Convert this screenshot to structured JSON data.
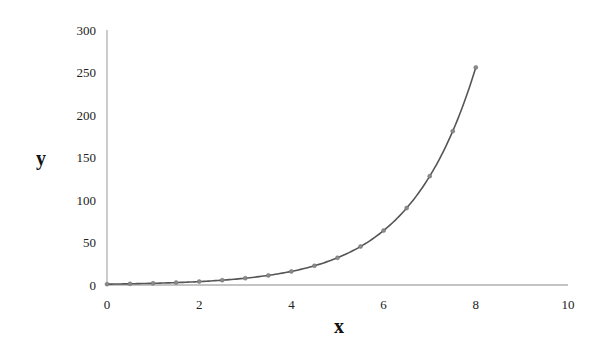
{
  "chart_data": {
    "type": "line",
    "title": "",
    "xlabel": "x",
    "ylabel": "y",
    "xlim": [
      0,
      10
    ],
    "ylim": [
      0,
      300
    ],
    "x_ticks": [
      0,
      2,
      4,
      6,
      8,
      10
    ],
    "y_ticks": [
      0,
      50,
      100,
      150,
      200,
      250,
      300
    ],
    "grid": false,
    "legend": null,
    "series": [
      {
        "name": "y = 2^x",
        "markers": true,
        "x": [
          0,
          0.5,
          1,
          1.5,
          2,
          2.5,
          3,
          3.5,
          4,
          4.5,
          5,
          5.5,
          6,
          6.5,
          7,
          7.5,
          8
        ],
        "values": [
          1,
          1.41,
          2,
          2.83,
          4,
          5.66,
          8,
          11.31,
          16,
          22.63,
          32,
          45.25,
          64,
          90.51,
          128,
          181.02,
          256
        ]
      }
    ]
  },
  "colors": {
    "line": "#555555",
    "marker": "#8a8a8a",
    "axis": "#b0b0b0",
    "text": "#222222"
  }
}
